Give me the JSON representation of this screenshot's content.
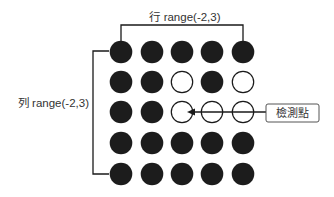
{
  "labels": {
    "columns_bracket": "行 range(-2,3)",
    "rows_bracket": "列 range(-2,3)",
    "callout": "檢測點"
  },
  "colors": {
    "filled": "#1c1c1c",
    "empty_fill": "#ffffff",
    "stroke": "#1a1a1a",
    "text": "#333333"
  },
  "grid": {
    "rows": 5,
    "cols": 5,
    "cells": [
      [
        1,
        1,
        1,
        1,
        1
      ],
      [
        1,
        1,
        0,
        1,
        0
      ],
      [
        1,
        1,
        0,
        0,
        0
      ],
      [
        1,
        1,
        1,
        1,
        1
      ],
      [
        1,
        1,
        1,
        1,
        1
      ]
    ],
    "legend": {
      "1": "filled",
      "0": "empty"
    },
    "detection_point": {
      "row": 2,
      "col": 2
    }
  }
}
